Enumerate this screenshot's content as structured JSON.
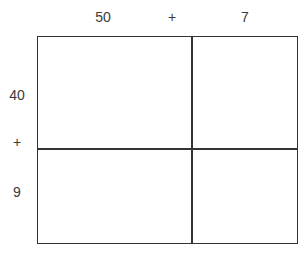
{
  "diagram": {
    "type": "area-model-multiplication",
    "top_labels": [
      {
        "text": "50",
        "x": 103
      },
      {
        "text": "+",
        "x": 172
      },
      {
        "text": "7",
        "x": 245
      }
    ],
    "side_labels": [
      {
        "text": "40",
        "y": 94
      },
      {
        "text": "+",
        "y": 141
      },
      {
        "text": "9",
        "y": 191
      }
    ],
    "cells": [
      {
        "row": 0,
        "col": 0,
        "value": ""
      },
      {
        "row": 0,
        "col": 1,
        "value": ""
      },
      {
        "row": 1,
        "col": 0,
        "value": ""
      },
      {
        "row": 1,
        "col": 1,
        "value": ""
      }
    ],
    "line_color": "#333333"
  }
}
